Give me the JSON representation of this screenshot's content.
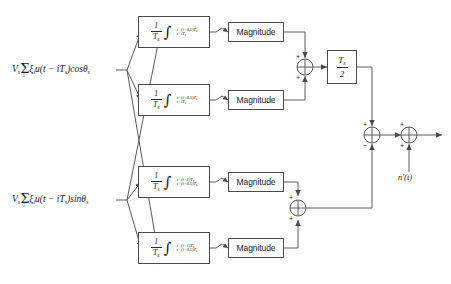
{
  "diagram": {
    "inputs": [
      {
        "id": "in-cos",
        "text": "V  ξ u(t − iT )cosθ",
        "rendered": "V_s Σ_i ξ_i u(t - iT_s) cos θ_s"
      },
      {
        "id": "in-sin",
        "text": "V  ξ u(t − iT )sinθ",
        "rendered": "V_s Σ_i ξ_i u(t - iT_s) sin θ_s"
      }
    ],
    "input_parts": {
      "V": "V",
      "V_sub": "s",
      "sigma": "Σ",
      "sigma_index": "i",
      "xi": "ξ",
      "xi_sub": "i",
      "u_open": "u(t − iT",
      "T_sub": "s",
      "close_cos": ")cosθ",
      "close_sin": ")sinθ",
      "theta_sub": "s"
    },
    "integrators": [
      {
        "id": "integ-1",
        "coef_num": "1",
        "coef_den": "T",
        "coef_den_sub": "s",
        "upper": "t+(i+0.5)T",
        "upper_sub": "s",
        "lower": "t+iT",
        "lower_sub": "s"
      },
      {
        "id": "integ-2",
        "coef_num": "1",
        "coef_den": "T",
        "coef_den_sub": "s",
        "upper": "t+(i+0.5)T",
        "upper_sub": "s",
        "lower": "t+iT",
        "lower_sub": "s"
      },
      {
        "id": "integ-3",
        "coef_num": "1",
        "coef_den": "T",
        "coef_den_sub": "s",
        "upper": "t+(i+1)T",
        "upper_sub": "s",
        "lower": "t+(i+0.5)T",
        "lower_sub": "s"
      },
      {
        "id": "integ-4",
        "coef_num": "1",
        "coef_den": "T",
        "coef_den_sub": "s",
        "upper": "t+(i+1)T",
        "upper_sub": "s",
        "lower": "t+(i+0.5)T",
        "lower_sub": "s"
      }
    ],
    "magnitude_blocks": [
      {
        "id": "magnitude-1",
        "label": "Magnitude"
      },
      {
        "id": "magnitude-2",
        "label": "Magnitude"
      },
      {
        "id": "magnitude-3",
        "label": "Magnitude"
      },
      {
        "id": "magnitude-4",
        "label": "Magnitude"
      }
    ],
    "gain_block": {
      "id": "gain-ts-over-2",
      "num": "T",
      "num_sub": "s",
      "den": "2"
    },
    "summers": [
      {
        "id": "summer-top",
        "signs": [
          "+",
          "+"
        ]
      },
      {
        "id": "summer-bottom",
        "signs": [
          "+",
          "+"
        ]
      },
      {
        "id": "summer-diff",
        "signs": [
          "+",
          "−"
        ]
      },
      {
        "id": "summer-output",
        "signs": [
          "+",
          "+"
        ]
      }
    ],
    "output": {
      "id": "output-signal",
      "label": "n′(t)"
    },
    "colors": {
      "stroke": "#4a4a4a",
      "wire": "#5a5a5a",
      "text": "#1a1a1a",
      "background": "#ffffff"
    }
  }
}
